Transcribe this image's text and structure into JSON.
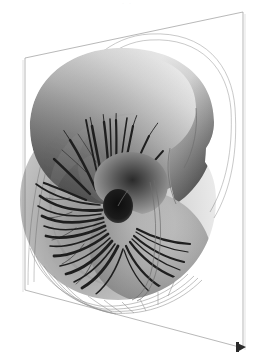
{
  "figure": {
    "rendering": "grayscale shaded surface with cut-away septa",
    "background_color": "#ffffff",
    "faint_top_artifact": "· ·",
    "canvas": {
      "width": 255,
      "height": 363
    }
  },
  "plane": {
    "name": "bounding-plane",
    "stroke_color": "#9a9a9a",
    "stroke_width": 0.7,
    "corners": {
      "top_left": [
        25,
        58
      ],
      "top_right": [
        243,
        12
      ],
      "bottom_right": [
        243,
        348
      ],
      "bottom_left": [
        25,
        290
      ]
    }
  },
  "marker": {
    "name": "corner-marker",
    "color": "#2b2b2b",
    "position": [
      240,
      347
    ],
    "size": 7
  },
  "shell": {
    "name": "nautilus-shell",
    "center_umbilicus": [
      117,
      205
    ],
    "umbilicus_color": "#161616",
    "outer_radius": 100,
    "spiral_turns": 2.6,
    "shading": {
      "highlight": "#f4f4f4",
      "midtone": "#b8b8b8",
      "shadow": "#6e6e6e",
      "deep_shadow": "#3a3a3a"
    },
    "septa_count": 34,
    "septa_color": "#1f1f1f",
    "wireframe_color": "#8d8d8d"
  },
  "outline_curve": {
    "name": "shell-outline-wireframe",
    "stroke_color": "#a5a5a5",
    "stroke_width": 0.6
  }
}
